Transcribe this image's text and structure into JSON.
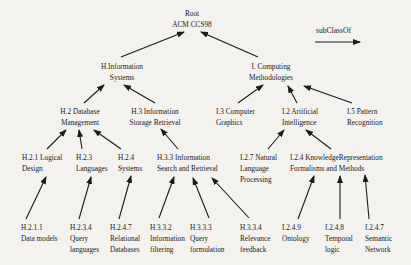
{
  "colors": {
    "ink": "#1b1b1b",
    "paper": "#f3f2ef"
  },
  "legend": {
    "label": "subClassOf",
    "arrow": {
      "x1": 315,
      "y1": 42,
      "x2": 360,
      "y2": 42
    }
  },
  "nodes": [
    {
      "id": "root",
      "lines": [
        "Root",
        "ACM CCS98"
      ],
      "x": 192,
      "y": 8,
      "align": "center"
    },
    {
      "id": "h-information-systems",
      "lines": [
        "H.Information",
        "Systems"
      ],
      "x": 122,
      "y": 61,
      "align": "center"
    },
    {
      "id": "i-computing-methodologies",
      "lines": [
        "I. Computing",
        "Methodologies"
      ],
      "x": 271,
      "y": 61,
      "align": "center"
    },
    {
      "id": "h2-database-management",
      "lines": [
        "H.2 Database",
        "Management"
      ],
      "x": 80,
      "y": 106,
      "align": "center"
    },
    {
      "id": "h3-information-storage-retrieval",
      "lines": [
        "H.3 Information",
        "Storage Retrieval"
      ],
      "x": 155,
      "y": 106,
      "align": "center"
    },
    {
      "id": "i3-computer-graphics",
      "lines": [
        "I.3 Computer",
        "Graphics"
      ],
      "x": 216,
      "y": 106,
      "align": "left"
    },
    {
      "id": "i2-artificial-intelligence",
      "lines": [
        "I.2 Artificial",
        "Intelligence"
      ],
      "x": 282,
      "y": 106,
      "align": "left"
    },
    {
      "id": "i5-pattern-recognition",
      "lines": [
        "I.5 Pattern",
        "Recognition"
      ],
      "x": 347,
      "y": 106,
      "align": "left"
    },
    {
      "id": "h21-logical-design",
      "lines": [
        "H.2.1 Logical",
        "Design"
      ],
      "x": 22,
      "y": 152,
      "align": "left"
    },
    {
      "id": "h23-languages",
      "lines": [
        "H.2.3",
        "Languages"
      ],
      "x": 76,
      "y": 152,
      "align": "left"
    },
    {
      "id": "h24-systems",
      "lines": [
        "H.2.4",
        "Systems"
      ],
      "x": 118,
      "y": 152,
      "align": "left"
    },
    {
      "id": "h33-information-search-retrieval",
      "lines": [
        "H.3.3 Information",
        "Search and Retrieval"
      ],
      "x": 157,
      "y": 152,
      "align": "left"
    },
    {
      "id": "i27-natural-language-processing",
      "lines": [
        "I.2.7 Natural",
        "Language",
        "Processing"
      ],
      "x": 240,
      "y": 152,
      "align": "left"
    },
    {
      "id": "i24-knowledge-representation",
      "lines": [
        "I.2.4 KnowledgeRepresentation",
        "Formalisms and Methods"
      ],
      "x": 290,
      "y": 152,
      "align": "left"
    },
    {
      "id": "h2111-data-models",
      "lines": [
        "H.2.1.1",
        "Data models"
      ],
      "x": 21,
      "y": 222,
      "align": "left"
    },
    {
      "id": "h234-query-languages",
      "lines": [
        "H.2.3.4",
        "Query",
        "languages"
      ],
      "x": 70,
      "y": 222,
      "align": "left"
    },
    {
      "id": "h247-relational-databases",
      "lines": [
        "H.2.4.7",
        "Relational",
        "Databases"
      ],
      "x": 110,
      "y": 222,
      "align": "left"
    },
    {
      "id": "h332-information-filtering",
      "lines": [
        "H.3.3.2",
        "Information",
        "filtering"
      ],
      "x": 150,
      "y": 222,
      "align": "left"
    },
    {
      "id": "h333-query-formulation",
      "lines": [
        "H.3.3.3",
        "Query",
        "formulation"
      ],
      "x": 190,
      "y": 222,
      "align": "left"
    },
    {
      "id": "h334-relevance-feedback",
      "lines": [
        "H.3.3.4",
        "Relevance",
        "feedback"
      ],
      "x": 240,
      "y": 222,
      "align": "left"
    },
    {
      "id": "i249-ontology",
      "lines": [
        "I.2.4.9",
        "Ontology"
      ],
      "x": 282,
      "y": 222,
      "align": "left"
    },
    {
      "id": "i248-temporal-logic",
      "lines": [
        "I.2.4.8",
        "Temporal",
        "logic"
      ],
      "x": 325,
      "y": 222,
      "align": "left"
    },
    {
      "id": "i247-semantic-network",
      "lines": [
        "I.2.4.7",
        "Semantic",
        "Network"
      ],
      "x": 365,
      "y": 222,
      "align": "left"
    }
  ],
  "edges": [
    {
      "from": "h-information-systems",
      "to": "root",
      "x1": 121,
      "y1": 57,
      "x2": 184,
      "y2": 32
    },
    {
      "from": "i-computing-methodologies",
      "to": "root",
      "x1": 258,
      "y1": 57,
      "x2": 201,
      "y2": 32
    },
    {
      "from": "h2-database-management",
      "to": "h-information-systems",
      "x1": 84,
      "y1": 103,
      "x2": 104,
      "y2": 85
    },
    {
      "from": "h3-information-storage-retrieval",
      "to": "h-information-systems",
      "x1": 155,
      "y1": 103,
      "x2": 124,
      "y2": 85
    },
    {
      "from": "i3-computer-graphics",
      "to": "i-computing-methodologies",
      "x1": 238,
      "y1": 103,
      "x2": 263,
      "y2": 85
    },
    {
      "from": "i2-artificial-intelligence",
      "to": "i-computing-methodologies",
      "x1": 297,
      "y1": 103,
      "x2": 288,
      "y2": 86
    },
    {
      "from": "i5-pattern-recognition",
      "to": "i-computing-methodologies",
      "x1": 352,
      "y1": 103,
      "x2": 304,
      "y2": 86
    },
    {
      "from": "h21-logical-design",
      "to": "h2-database-management",
      "x1": 47,
      "y1": 149,
      "x2": 66,
      "y2": 130
    },
    {
      "from": "h23-languages",
      "to": "h2-database-management",
      "x1": 82,
      "y1": 149,
      "x2": 79,
      "y2": 130
    },
    {
      "from": "h24-systems",
      "to": "h2-database-management",
      "x1": 121,
      "y1": 149,
      "x2": 94,
      "y2": 130
    },
    {
      "from": "h33-information-search-retrieval",
      "to": "h3-information-storage-retrieval",
      "x1": 178,
      "y1": 149,
      "x2": 161,
      "y2": 129
    },
    {
      "from": "i27-natural-language-processing",
      "to": "i2-artificial-intelligence",
      "x1": 268,
      "y1": 149,
      "x2": 284,
      "y2": 130
    },
    {
      "from": "i24-knowledge-representation",
      "to": "i2-artificial-intelligence",
      "x1": 331,
      "y1": 149,
      "x2": 306,
      "y2": 130
    },
    {
      "from": "h2111-data-models",
      "to": "h21-logical-design",
      "x1": 26,
      "y1": 219,
      "x2": 46,
      "y2": 177
    },
    {
      "from": "h234-query-languages",
      "to": "h23-languages",
      "x1": 79,
      "y1": 219,
      "x2": 91,
      "y2": 177
    },
    {
      "from": "h247-relational-databases",
      "to": "h24-systems",
      "x1": 119,
      "y1": 219,
      "x2": 131,
      "y2": 176
    },
    {
      "from": "h332-information-filtering",
      "to": "h33-information-search-retrieval",
      "x1": 159,
      "y1": 218,
      "x2": 174,
      "y2": 177
    },
    {
      "from": "h333-query-formulation",
      "to": "h33-information-search-retrieval",
      "x1": 209,
      "y1": 218,
      "x2": 193,
      "y2": 178
    },
    {
      "from": "h334-relevance-feedback",
      "to": "h33-information-search-retrieval",
      "x1": 249,
      "y1": 218,
      "x2": 212,
      "y2": 178
    },
    {
      "from": "i249-ontology",
      "to": "i24-knowledge-representation",
      "x1": 298,
      "y1": 219,
      "x2": 314,
      "y2": 176
    },
    {
      "from": "i248-temporal-logic",
      "to": "i24-knowledge-representation",
      "x1": 340,
      "y1": 219,
      "x2": 340,
      "y2": 176
    },
    {
      "from": "i247-semantic-network",
      "to": "i24-knowledge-representation",
      "x1": 369,
      "y1": 219,
      "x2": 365,
      "y2": 175
    }
  ]
}
